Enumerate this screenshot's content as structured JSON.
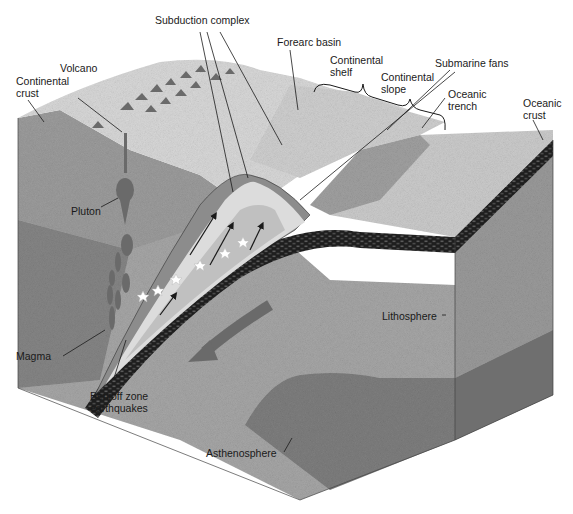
{
  "figure": {
    "colors": {
      "background": "#ffffff",
      "continental_crust": "#9a9a9a",
      "lithosphere": "#a3a3a3",
      "asthenosphere": "#7e7e7e",
      "oceanic_crust": "#2a2a2a",
      "surface_light": "#d6d6d6",
      "wedge_light": "#dcdcdc",
      "wedge_dark": "#8c8c8c",
      "leader_line": "#1a1a1a"
    }
  },
  "labels": {
    "subduction_complex": "Subduction complex",
    "forearc_basin": "Forearc basin",
    "continental_shelf": "Continental\nshelf",
    "submarine_fans": "Submarine fans",
    "continental_slope": "Continental\nslope",
    "oceanic_trench": "Oceanic\ntrench",
    "oceanic_crust": "Oceanic\ncrust",
    "volcano": "Volcano",
    "continental_crust": "Continental\ncrust",
    "pluton": "Pluton",
    "lithosphere": "Lithosphere",
    "magma": "Magma",
    "benioff": "Benioff zone\nearthquakes",
    "asthenosphere": "Asthenosphere"
  }
}
